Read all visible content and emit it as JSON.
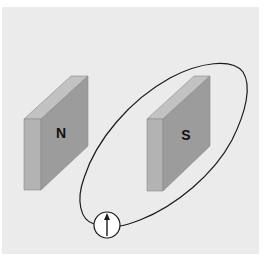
{
  "diagram": {
    "colors": {
      "background": "#ffffff",
      "panel": "#ebebeb",
      "magnet_front": "#9c9c9c",
      "magnet_side": "#b3b3b3",
      "magnet_top": "#c2c2c2",
      "wire": "#1a1a1a",
      "meter_fill": "#ffffff"
    },
    "magnets": [
      {
        "id": "north",
        "label": "N"
      },
      {
        "id": "south",
        "label": "S"
      }
    ],
    "meter": {
      "type": "galvanometer",
      "needle_direction": "up",
      "icon": "arrow-up-icon"
    },
    "loop": {
      "shape": "ellipse",
      "encloses": "S"
    }
  }
}
